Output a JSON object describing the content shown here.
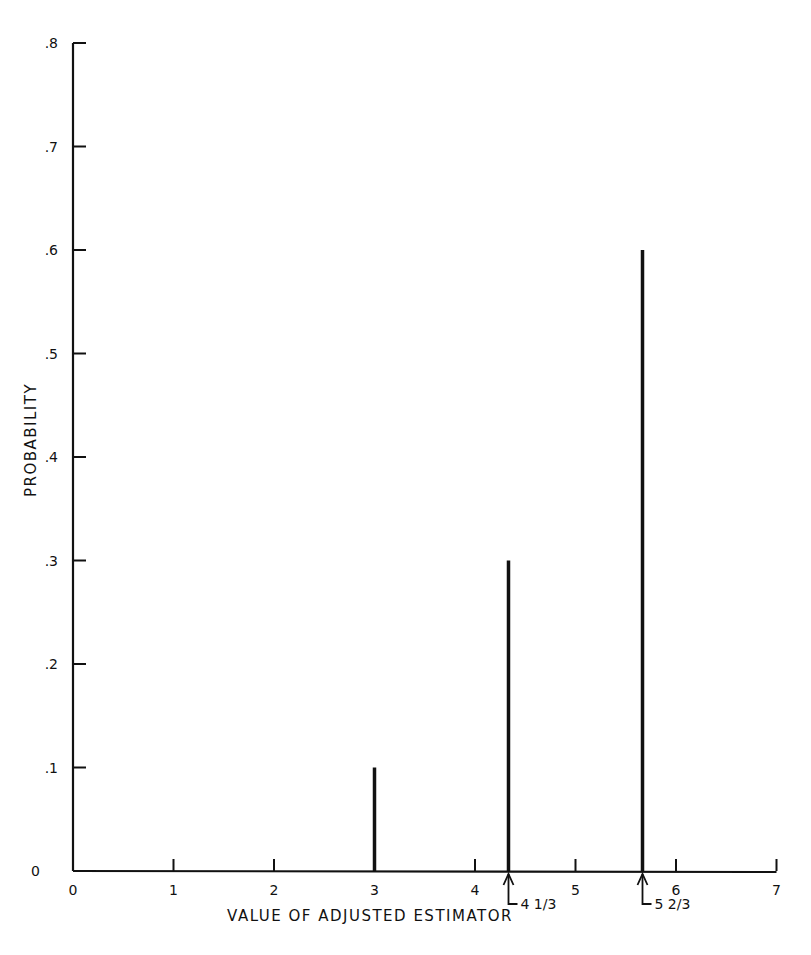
{
  "chart_data": {
    "type": "bar",
    "subtype": "stem",
    "title": "",
    "xlabel": "VALUE OF ADJUSTED ESTIMATOR",
    "ylabel": "PROBABILITY",
    "x": [
      3,
      4.3333,
      5.6667
    ],
    "values": [
      0.1,
      0.3,
      0.6
    ],
    "categories": [
      "3",
      "4 1/3",
      "5 2/3"
    ],
    "xlim": [
      0,
      7
    ],
    "ylim": [
      0,
      0.8
    ],
    "xticks": [
      "0",
      "1",
      "2",
      "3",
      "4",
      "5",
      "6",
      "7"
    ],
    "yticks": [
      "0",
      ".1",
      ".2",
      ".3",
      ".4",
      ".5",
      ".6",
      ".7",
      ".8"
    ],
    "annotations": [
      {
        "text": "4 1/3",
        "x": 4.3333,
        "arrow": "up"
      },
      {
        "text": "5 2/3",
        "x": 5.6667,
        "arrow": "up"
      }
    ],
    "grid": false,
    "legend": null
  },
  "axes": {
    "xlabel": "VALUE OF ADJUSTED ESTIMATOR",
    "ylabel": "PROBABILITY",
    "x_origin_label": "0",
    "y_origin_label": "0"
  }
}
